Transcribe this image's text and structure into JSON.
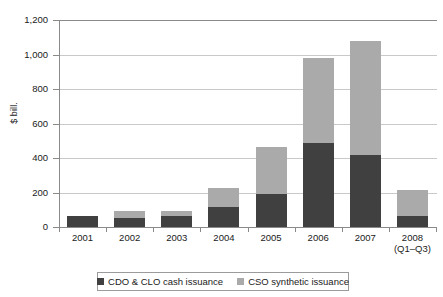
{
  "chart_data": {
    "type": "bar",
    "subtype": "stacked-bar",
    "title": "",
    "xlabel": "",
    "ylabel": "$ bill.",
    "ylim": [
      0,
      1200
    ],
    "yticks": [
      "0",
      "200",
      "400",
      "600",
      "800",
      "1,000",
      "1,200"
    ],
    "ytick_values": [
      0,
      200,
      400,
      600,
      800,
      1000,
      1200
    ],
    "grid": true,
    "legend_position": "bottom",
    "categories": [
      "2001",
      "2002",
      "2003",
      "2004",
      "2005",
      "2006",
      "2007",
      "2008"
    ],
    "category_sublabels": [
      "",
      "",
      "",
      "",
      "",
      "",
      "",
      "(Q1–Q3)"
    ],
    "series": [
      {
        "name": "CDO & CLO cash issuance",
        "color": "#404040",
        "values": [
          65,
          52,
          62,
          115,
          193,
          487,
          420,
          62
        ]
      },
      {
        "name": "CSO synthetic issuance",
        "color": "#aaaaaa",
        "values": [
          0,
          38,
          32,
          110,
          272,
          493,
          658,
          152
        ]
      }
    ],
    "totals": [
      65,
      90,
      94,
      225,
      465,
      980,
      1078,
      214
    ]
  },
  "axis": {
    "y_title": "$ bill."
  },
  "legend": {
    "items": [
      {
        "label": "CDO & CLO cash issuance",
        "color": "#404040"
      },
      {
        "label": "CSO synthetic issuance",
        "color": "#aaaaaa"
      }
    ]
  },
  "colors": {
    "dark_series": "#404040",
    "light_series": "#aaaaaa",
    "axis": "#8a8a8a",
    "gridline": "#c9c9c9",
    "text": "#1a1a1a",
    "background": "#ffffff"
  }
}
